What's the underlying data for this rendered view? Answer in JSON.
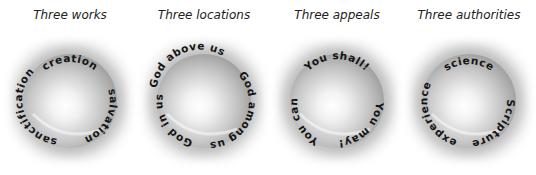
{
  "figure": {
    "panels": [
      {
        "id": "works",
        "caption": "Three works",
        "labels": {
          "top": "creation",
          "right": "salvation",
          "left": "sanctification"
        }
      },
      {
        "id": "locations",
        "caption": "Three locations",
        "labels": {
          "top": "God above us",
          "right": "God among us",
          "left": "God in us"
        }
      },
      {
        "id": "appeals",
        "caption": "Three appeals",
        "labels": {
          "top": "You shall!",
          "right": "You may!",
          "left": "You can!"
        }
      },
      {
        "id": "authorities",
        "caption": "Three authorities",
        "labels": {
          "top": "science",
          "right": "Scripture",
          "left": "experience"
        }
      }
    ]
  }
}
